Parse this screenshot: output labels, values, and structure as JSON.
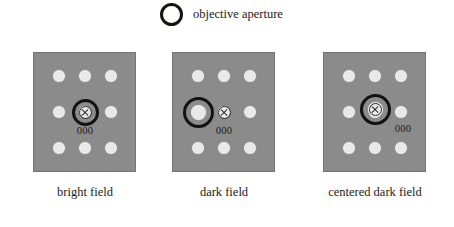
{
  "legend": {
    "icon": "objective-aperture-ring-icon",
    "label": "objective aperture"
  },
  "colors": {
    "panel_background": "#8b8b8b",
    "spot": "#e9e9e9",
    "aperture_ring": "#121212",
    "text": "#1a1a1a",
    "page_background": "#ffffff"
  },
  "diagram": {
    "spot_grid": {
      "rows": 3,
      "cols": 3,
      "xs": [
        26,
        52,
        78
      ],
      "ys": [
        24,
        60,
        96
      ]
    },
    "panels": [
      {
        "id": "bright-field",
        "caption": "bright field",
        "left": 33,
        "aperture": {
          "x": 52,
          "y": 60,
          "wide": false
        },
        "xmark": {
          "x": 52,
          "y": 60
        },
        "big_spot": null,
        "zero_label": {
          "text": "000",
          "x": 52,
          "y": 74
        }
      },
      {
        "id": "dark-field",
        "caption": "dark field",
        "left": 172,
        "aperture": {
          "x": 26,
          "y": 60,
          "wide": true
        },
        "xmark": {
          "x": 52,
          "y": 60
        },
        "big_spot": {
          "x": 26,
          "y": 60
        },
        "zero_label": {
          "text": "000",
          "x": 52,
          "y": 74
        }
      },
      {
        "id": "centered-dark-field",
        "caption": "centered dark field",
        "left": 323,
        "aperture": {
          "x": 52,
          "y": 57,
          "wide": true
        },
        "xmark": {
          "x": 52,
          "y": 57
        },
        "big_spot": {
          "x": 52,
          "y": 57
        },
        "zero_label": {
          "text": "000",
          "x": 80,
          "y": 72
        }
      }
    ]
  },
  "captions": {
    "bright_field": "bright field",
    "dark_field": "dark field",
    "centered_dark_field": "centered dark field"
  },
  "caption_positions": {
    "bright_field_x": 85,
    "dark_field_x": 224,
    "centered_dark_field_x": 375
  }
}
